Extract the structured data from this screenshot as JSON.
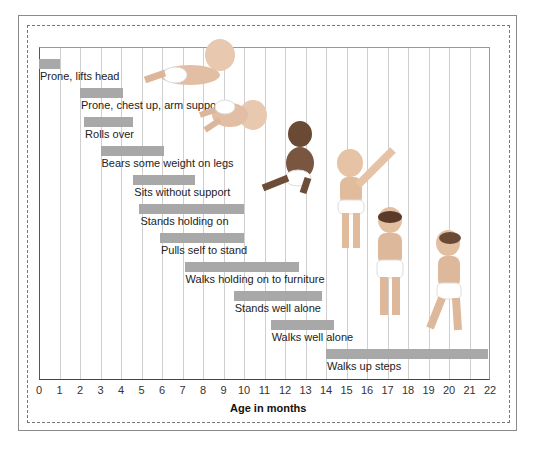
{
  "chart_data": {
    "type": "bar",
    "subtype": "horizontal-range (gantt)",
    "title": "",
    "xlabel": "Age in months",
    "ylabel": "",
    "xlim": [
      0,
      22
    ],
    "x_ticks": [
      "0",
      "1",
      "2",
      "3",
      "4",
      "5",
      "6",
      "7",
      "8",
      "9",
      "10",
      "11",
      "12",
      "13",
      "14",
      "15",
      "16",
      "17",
      "18",
      "19",
      "20",
      "21",
      "22"
    ],
    "grid": true,
    "legend": null,
    "milestones": [
      {
        "label": "Prone, lifts head",
        "start": 0,
        "end": 1
      },
      {
        "label": "Prone, chest up, arm support",
        "start": 2,
        "end": 4.1
      },
      {
        "label": "Rolls over",
        "start": 2.2,
        "end": 4.6
      },
      {
        "label": "Bears some weight on legs",
        "start": 3,
        "end": 6.1
      },
      {
        "label": "Sits without support",
        "start": 4.6,
        "end": 7.6
      },
      {
        "label": "Stands holding on",
        "start": 4.9,
        "end": 10
      },
      {
        "label": "Pulls self to stand",
        "start": 5.9,
        "end": 10
      },
      {
        "label": "Walks holding on to furniture",
        "start": 7.1,
        "end": 12.7
      },
      {
        "label": "Stands well alone",
        "start": 9.5,
        "end": 13.8
      },
      {
        "label": "Walks well alone",
        "start": 11.3,
        "end": 14.4
      },
      {
        "label": "Walks up steps",
        "start": 14,
        "end": 21.9
      }
    ],
    "bar_color": "#a8a8a8",
    "illustrations": [
      "baby prone lifting head",
      "baby rolling over",
      "baby sitting",
      "baby standing holding hand",
      "toddler standing",
      "toddler walking"
    ]
  }
}
